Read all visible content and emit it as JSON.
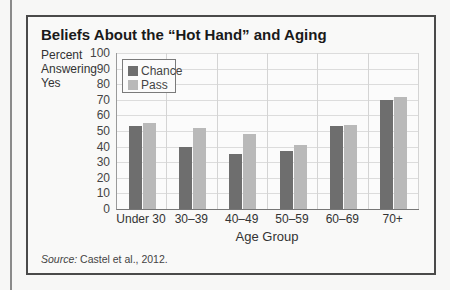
{
  "chart_data": {
    "type": "bar",
    "title": "Beliefs About the “Hot Hand” and Aging",
    "ylabel": "Percent Answering Yes",
    "xlabel": "Age Group",
    "ylim": [
      0,
      100
    ],
    "yticks": [
      0,
      10,
      20,
      30,
      40,
      50,
      60,
      70,
      80,
      90,
      100
    ],
    "categories": [
      "Under 30",
      "30–39",
      "40–49",
      "50–59",
      "60–69",
      "70+"
    ],
    "series": [
      {
        "name": "Chance",
        "color": "#6e6e6e",
        "values": [
          53,
          40,
          35,
          37,
          53,
          70
        ]
      },
      {
        "name": "Pass",
        "color": "#b9b9b9",
        "values": [
          55,
          52,
          48,
          41,
          54,
          72
        ]
      }
    ],
    "grid": true,
    "legend_position": "upper-left"
  },
  "labels": {
    "ylabel_lines": [
      "Percent",
      "Answering",
      "Yes"
    ],
    "source_prefix": "Source:",
    "source_text": " Castel et al., 2012."
  }
}
